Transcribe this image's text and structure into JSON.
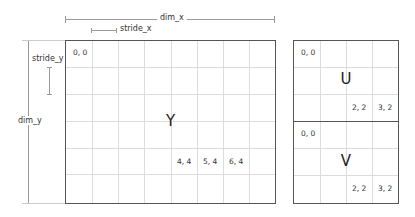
{
  "dimensions": {
    "dim_x": "dim_x",
    "dim_y": "dim_y",
    "stride_x": "stride_x",
    "stride_y": "stride_y"
  },
  "planes": {
    "y": {
      "label": "Y",
      "columns": 8,
      "rows": 6,
      "cells": [
        {
          "text": "0, 0",
          "col": 0,
          "row": 0
        },
        {
          "text": "4, 4",
          "col": 4,
          "row": 4
        },
        {
          "text": "5, 4",
          "col": 5,
          "row": 4
        },
        {
          "text": "6, 4",
          "col": 6,
          "row": 4
        }
      ]
    },
    "u": {
      "label": "U",
      "columns": 4,
      "rows": 3,
      "cells": [
        {
          "text": "0, 0",
          "col": 0,
          "row": 0
        },
        {
          "text": "2, 2",
          "col": 2,
          "row": 2
        },
        {
          "text": "3, 2",
          "col": 3,
          "row": 2
        }
      ]
    },
    "v": {
      "label": "V",
      "columns": 4,
      "rows": 3,
      "cells": [
        {
          "text": "0, 0",
          "col": 0,
          "row": 0
        },
        {
          "text": "2, 2",
          "col": 2,
          "row": 2
        },
        {
          "text": "3, 2",
          "col": 3,
          "row": 2
        }
      ]
    }
  },
  "colors": {
    "border": "#555555",
    "grid": "#dcdcdc",
    "dimension_line": "#999999"
  }
}
